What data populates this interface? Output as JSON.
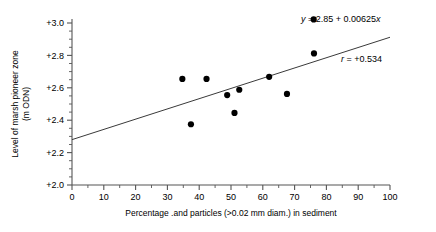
{
  "chart_data": {
    "type": "scatter",
    "title": "",
    "xlabel": "Percentage .and particles (>0.02 mm diam.) in sediment",
    "ylabel_line1": "Level of marsh pioneer zone",
    "ylabel_line2": "(m ODN)",
    "xlim": [
      0,
      100
    ],
    "ylim": [
      2.0,
      3.0
    ],
    "grid": false,
    "legend": "none",
    "x_ticks": [
      0,
      10,
      20,
      30,
      40,
      50,
      60,
      70,
      80,
      90,
      100
    ],
    "x_tick_labels": [
      "0",
      "10",
      "20",
      "30",
      "40",
      "50",
      "60",
      "70",
      "80",
      "90",
      "100"
    ],
    "x_minor_step": 5,
    "y_ticks": [
      2.0,
      2.2,
      2.4,
      2.6,
      2.8,
      3.0
    ],
    "y_tick_labels": [
      "+2.0",
      "+2.2",
      "+2.4",
      "+2.6",
      "+2.8",
      "+3.0"
    ],
    "y_minor_step": 0.05,
    "points": [
      {
        "x": 34.7,
        "y": 2.655
      },
      {
        "x": 37.4,
        "y": 2.375
      },
      {
        "x": 42.3,
        "y": 2.655
      },
      {
        "x": 48.8,
        "y": 2.555
      },
      {
        "x": 51.1,
        "y": 2.445
      },
      {
        "x": 52.6,
        "y": 2.588
      },
      {
        "x": 62.0,
        "y": 2.668
      },
      {
        "x": 67.6,
        "y": 2.562
      },
      {
        "x": 76.1,
        "y": 2.812
      },
      {
        "x": 76.0,
        "y": 3.022
      }
    ],
    "fit_line": {
      "x_start": 0,
      "y_start": 2.28,
      "x_end": 100,
      "y_end": 2.912
    },
    "annotations": {
      "equation_prefix": "y",
      "equation_body": " = 2.85 + 0.00625",
      "equation_var": "x",
      "equation_full": "y = 2.85 + 0.00625x",
      "correlation_prefix": "r",
      "correlation_body": " = +0.534",
      "correlation_full": "r = +0.534"
    },
    "colors": {
      "point": "#000000",
      "line": "#3a3a3a",
      "axis": "#555555",
      "text": "#000000",
      "background": "#ffffff"
    }
  }
}
